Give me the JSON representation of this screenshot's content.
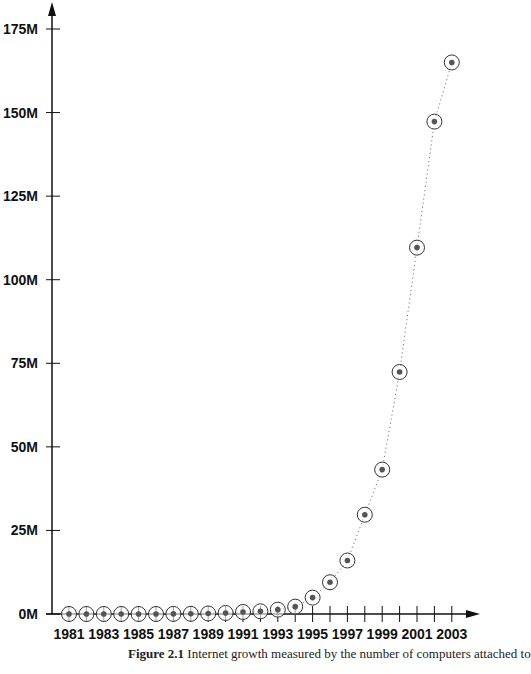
{
  "chart_data": {
    "type": "line",
    "title": "",
    "xlabel": "",
    "ylabel": "",
    "x": [
      1981,
      1982,
      1983,
      1984,
      1985,
      1986,
      1987,
      1988,
      1989,
      1990,
      1991,
      1992,
      1993,
      1994,
      1995,
      1996,
      1997,
      1998,
      1999,
      2000,
      2001,
      2002,
      2003
    ],
    "values": [
      0.0002,
      0.0002,
      0.0006,
      0.001,
      0.002,
      0.005,
      0.028,
      0.056,
      0.16,
      0.31,
      0.6,
      0.8,
      1.3,
      2.2,
      4.9,
      9.5,
      16,
      29.7,
      43.2,
      72.4,
      109.6,
      147.3,
      165
    ],
    "series": [
      {
        "name": "Computers attached to the Internet (millions)",
        "marker": "circled-dot",
        "line_style": "dotted"
      }
    ],
    "x_tick_labels": [
      "1981",
      "1983",
      "1985",
      "1987",
      "1989",
      "1991",
      "1993",
      "1995",
      "1997",
      "1999",
      "2001",
      "2003"
    ],
    "y_tick_labels": [
      "0M",
      "25M",
      "50M",
      "75M",
      "100M",
      "125M",
      "150M",
      "175M"
    ],
    "y_ticks": [
      0,
      25,
      50,
      75,
      100,
      125,
      150,
      175
    ],
    "ylim": [
      0,
      180
    ],
    "xlim": [
      1980.5,
      2004
    ],
    "grid": false,
    "legend": null
  },
  "caption": {
    "label": "Figure 2.1",
    "text": " Internet growth measured by the number of computers attached to"
  },
  "colors": {
    "axis": "#111111",
    "marker_ring": "#333333",
    "marker_dot": "#555555",
    "line": "#777777"
  }
}
